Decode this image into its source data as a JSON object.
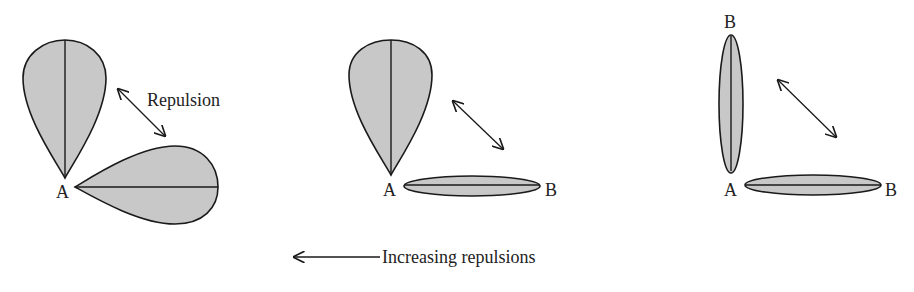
{
  "figure": {
    "panel_left": {
      "atom_label": "A",
      "repulsion_label": "Repulsion",
      "description": "lone pair – lone pair"
    },
    "panel_middle": {
      "atom_label": "A",
      "bonded_label": "B",
      "description": "lone pair – bond pair"
    },
    "panel_right": {
      "atom_label": "A",
      "bonded_label_top": "B",
      "bonded_label_right": "B",
      "description": "bond pair – bond pair"
    },
    "bottom_caption": "Increasing repulsions"
  },
  "colors": {
    "lobe_fill": "#c8c8c8",
    "stroke": "#1a1a1a",
    "text": "#222222"
  }
}
